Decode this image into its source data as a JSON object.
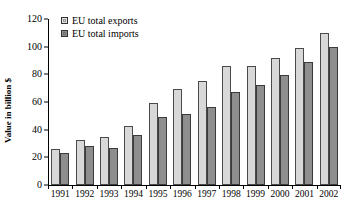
{
  "chart_data": {
    "type": "bar",
    "title": "",
    "xlabel": "",
    "ylabel": "Value in billion $",
    "ylim": [
      0,
      120
    ],
    "yticks": [
      0,
      20,
      40,
      60,
      80,
      100,
      120
    ],
    "grid": false,
    "legend_position": "top-left",
    "categories": [
      "1991",
      "1992",
      "1993",
      "1994",
      "1995",
      "1996",
      "1997",
      "1998",
      "1999",
      "2000",
      "2001",
      "2002"
    ],
    "series": [
      {
        "name": "EU total exports",
        "color": "#d8d8d8",
        "values": [
          26,
          32.5,
          35,
          42.5,
          59,
          69.5,
          75,
          86,
          86,
          92,
          99,
          110
        ]
      },
      {
        "name": "EU total imports",
        "color": "#8e8e8e",
        "values": [
          23.5,
          28,
          27,
          36,
          49,
          51,
          56.5,
          67,
          72,
          79.5,
          89,
          100
        ]
      }
    ]
  }
}
